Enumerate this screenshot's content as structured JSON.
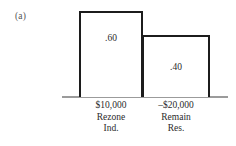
{
  "figure": {
    "panel_label": "(a)",
    "background_color": "#ffffff",
    "bar_outline_color": "#1c1c1c",
    "bar_fill_color": "#ffffff",
    "axis_color": "#9b9b9b",
    "text_color": "#2b2b2b"
  },
  "chart_data": {
    "type": "bar",
    "title": "",
    "xlabel": "",
    "ylabel": "",
    "ylim": [
      0,
      0.6
    ],
    "grid": false,
    "legend": false,
    "categories": [
      "$10,000 Rezone Ind.",
      "–$20,000 Remain Res."
    ],
    "values": [
      0.6,
      0.4
    ],
    "bars": [
      {
        "value": 0.6,
        "value_label": ".60",
        "payoff": "$10,000",
        "outcome_line_1": "Rezone",
        "outcome_line_2": "Ind."
      },
      {
        "value": 0.4,
        "value_label": ".40",
        "payoff": "–$20,000",
        "outcome_line_1": "Remain",
        "outcome_line_2": "Res."
      }
    ],
    "annotations": [
      "(a)"
    ]
  }
}
